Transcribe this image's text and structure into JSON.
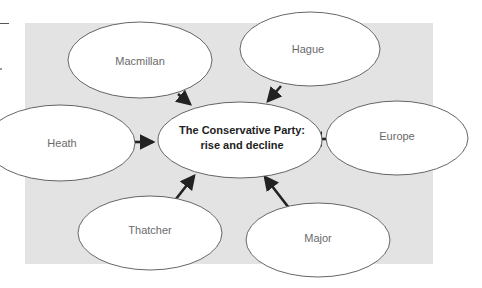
{
  "diagram": {
    "type": "spider-diagram",
    "center": {
      "line1": "The Conservative Party:",
      "line2": "rise and decline"
    },
    "nodes": [
      {
        "id": "macmillan",
        "label": "Macmillan"
      },
      {
        "id": "hague",
        "label": "Hague"
      },
      {
        "id": "heath",
        "label": "Heath"
      },
      {
        "id": "europe",
        "label": "Europe"
      },
      {
        "id": "thatcher",
        "label": "Thatcher"
      },
      {
        "id": "major",
        "label": "Major"
      }
    ],
    "edges": [
      {
        "from": "macmillan",
        "to": "center"
      },
      {
        "from": "hague",
        "to": "center"
      },
      {
        "from": "heath",
        "to": "center"
      },
      {
        "from": "europe",
        "to": "center"
      },
      {
        "from": "thatcher",
        "to": "center"
      },
      {
        "from": "major",
        "to": "center"
      }
    ],
    "colors": {
      "panel": "#e3e3e3",
      "node_fill": "#ffffff",
      "node_stroke": "#555555",
      "arrow": "#222222",
      "node_text": "#6a6a6a",
      "center_text": "#1e1e1e"
    }
  }
}
